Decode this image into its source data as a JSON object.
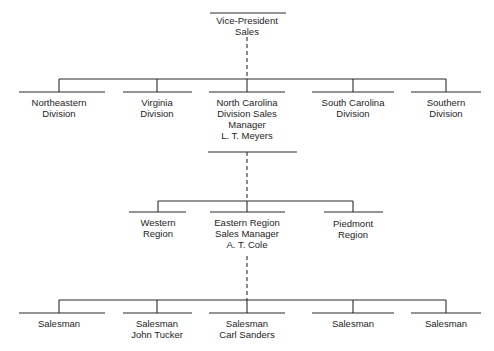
{
  "diagram": {
    "type": "org-chart",
    "header_text_cutoff": "",
    "root": {
      "lines": [
        "Vice-President",
        "Sales"
      ]
    },
    "level1": [
      {
        "lines": [
          "Northeastern",
          "Division"
        ]
      },
      {
        "lines": [
          "Virginia",
          "Division"
        ]
      },
      {
        "lines": [
          "North Carolina",
          "Division Sales",
          "Manager",
          "L. T. Meyers"
        ]
      },
      {
        "lines": [
          "South Carolina",
          "Division"
        ]
      },
      {
        "lines": [
          "Southern",
          "Division"
        ]
      }
    ],
    "level2": [
      {
        "lines": [
          "Western",
          "Region"
        ]
      },
      {
        "lines": [
          "Eastern Region",
          "Sales Manager",
          "A. T. Cole"
        ]
      },
      {
        "lines": [
          "Piedmont",
          "Region"
        ]
      }
    ],
    "level3": [
      {
        "lines": [
          "Salesman"
        ]
      },
      {
        "lines": [
          "Salesman",
          "John Tucker"
        ]
      },
      {
        "lines": [
          "Salesman",
          "Carl Sanders"
        ]
      },
      {
        "lines": [
          "Salesman"
        ]
      },
      {
        "lines": [
          "Salesman"
        ]
      }
    ],
    "colors": {
      "line": "#2a2a2a",
      "text": "#1e1e1e",
      "background": "#ffffff"
    }
  }
}
